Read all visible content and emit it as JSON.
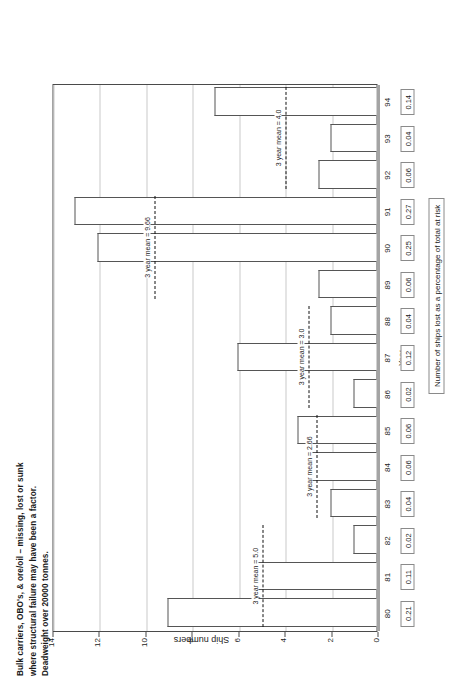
{
  "title": {
    "line1": "Bulk carriers, OBO's, & ore/oil – missing, lost or sunk",
    "line2": "where structural failure may have been a factor.",
    "line3": "Deadweight over 20000 tonnes."
  },
  "axes": {
    "y_label": "Ship numbers",
    "x_label": "Year",
    "y_ticks": [
      "14",
      "12",
      "10",
      "8",
      "6",
      "4",
      "2",
      "0"
    ]
  },
  "caption": "Number of ships lost as a percentage of total at risk",
  "chart_data": {
    "type": "bar",
    "title": "Bulk carriers, OBO's, & ore/oil – missing, lost or sunk where structural failure may have been a factor. Deadweight over 20000 tonnes.",
    "xlabel": "Year",
    "ylabel": "Ship numbers",
    "ylim": [
      0,
      14
    ],
    "grid": true,
    "orientation": "rotated-90",
    "categories": [
      "80",
      "81",
      "82",
      "83",
      "84",
      "85",
      "86",
      "87",
      "88",
      "89",
      "90",
      "91",
      "92",
      "93",
      "94"
    ],
    "values": [
      9,
      5.3,
      1,
      2,
      3,
      3.4,
      1,
      6,
      2,
      2.5,
      12,
      13,
      2.5,
      2,
      7
    ],
    "percent_at_risk": [
      "0.21",
      "0.11",
      "0.02",
      "0.04",
      "0.06",
      "0.06",
      "0.02",
      "0.12",
      "0.04",
      "0.06",
      "0.25",
      "0.27",
      "0.06",
      "0.04",
      "0.14"
    ],
    "annotations": [
      {
        "label": "3 year mean = 5.0",
        "value": 5.0,
        "span_start": "80",
        "span_end": "82"
      },
      {
        "label": "3 year mean = 2.66",
        "value": 2.66,
        "span_start": "83",
        "span_end": "85"
      },
      {
        "label": "3 year mean = 3.0",
        "value": 3.0,
        "span_start": "86",
        "span_end": "88"
      },
      {
        "label": "3 year mean = 9.66",
        "value": 9.66,
        "span_start": "89",
        "span_end": "91"
      },
      {
        "label": "3 year mean = 4.0",
        "value": 4.0,
        "span_start": "92",
        "span_end": "94"
      }
    ]
  }
}
